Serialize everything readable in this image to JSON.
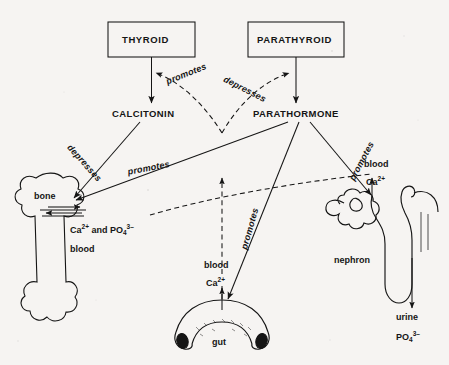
{
  "diagram": {
    "background_color": "#f6f4f2",
    "ink_color": "#151515"
  },
  "glands": [
    {
      "id": "thyroid",
      "label": "THYROID"
    },
    {
      "id": "parathyroid",
      "label": "PARATHYROID"
    }
  ],
  "hormones": [
    {
      "id": "calcitonin",
      "label": "CALCITONIN"
    },
    {
      "id": "parathormone",
      "label": "PARATHORMONE"
    }
  ],
  "organs": [
    {
      "id": "bone",
      "label": "bone"
    },
    {
      "id": "gut",
      "label": "gut"
    },
    {
      "id": "nephron",
      "label": "nephron"
    }
  ],
  "relations": [
    {
      "id": "promotes-calcitonin",
      "label": "promotes",
      "from": "blood-calcium",
      "to": "calcitonin",
      "style": "dashed"
    },
    {
      "id": "depresses-parathormone",
      "label": "depresses",
      "from": "blood-calcium",
      "to": "parathormone",
      "style": "dashed"
    },
    {
      "id": "depresses-bone",
      "label": "depresses",
      "from": "calcitonin",
      "to": "bone",
      "style": "solid"
    },
    {
      "id": "promotes-bone",
      "label": "promotes",
      "from": "parathormone",
      "to": "bone",
      "style": "solid"
    },
    {
      "id": "promotes-gut",
      "label": "promotes",
      "from": "parathormone",
      "to": "gut",
      "style": "solid"
    },
    {
      "id": "promotes-nephron",
      "label": "promotes",
      "from": "parathormone",
      "to": "nephron",
      "style": "solid"
    }
  ],
  "annotations": {
    "bone_exchange": "Ca2+ and PO43-",
    "bone_exchange_prefix": "Ca",
    "bone_exchange_mid": " and PO",
    "bone_blood": "blood",
    "gut_blood": "blood",
    "gut_calcium_prefix": "Ca",
    "nephron_blood": "blood",
    "nephron_calcium_prefix": "Ca",
    "urine_label": "urine",
    "urine_phosphate_prefix": "PO",
    "charge_2plus": "2+",
    "charge_3minus": "3–",
    "sub_4": "4"
  }
}
